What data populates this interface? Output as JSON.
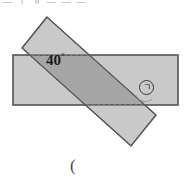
{
  "figure": {
    "angle": {
      "value": "40",
      "degree_symbol": "°",
      "label": "40°"
    },
    "marker": {
      "symbol": "ㄱ",
      "style": "circled"
    },
    "top_clipped_text": "ㅡ ㅣ ㅐ ㅡ ㅡ ㅡ",
    "bottom_clipped_text": "(",
    "colors": {
      "base_rect_fill": "#c9c9c9",
      "strip_fill": "#c4c4c4",
      "overlap_fill": "#a8a8a8",
      "outline": "#5a5a5a",
      "dashed_line": "#6e6e6e",
      "background": "#ffffff",
      "text": "#1a1a1a"
    },
    "geometry": {
      "base_rect": {
        "x1": 13,
        "y1": 55,
        "x2": 178,
        "y2": 105
      },
      "strip_angle_deg": "-40",
      "strip_width": "40",
      "strip_points": "47,17 22,48 131,146 156,115"
    }
  }
}
